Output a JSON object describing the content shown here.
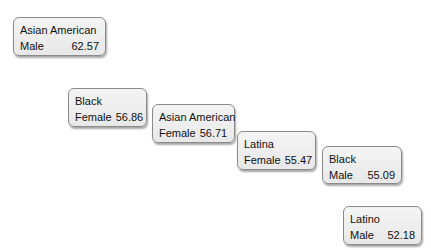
{
  "nodes": [
    {
      "group": "Asian American",
      "gender": "Male",
      "value": "62.57"
    },
    {
      "group": "Black",
      "gender": "Female",
      "value": "56.86"
    },
    {
      "group": "Asian American",
      "gender": "Female",
      "value": "56.71"
    },
    {
      "group": "Latina",
      "gender": "Female",
      "value": "55.47"
    },
    {
      "group": "Black",
      "gender": "Male",
      "value": "55.09"
    },
    {
      "group": "Latino",
      "gender": "Male",
      "value": "52.18"
    }
  ]
}
